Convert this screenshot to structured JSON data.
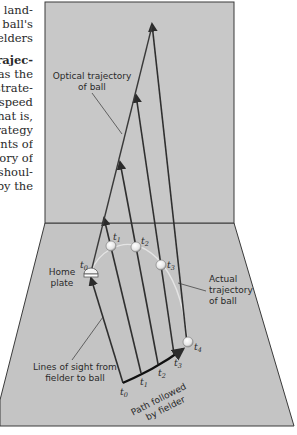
{
  "body_text": {
    "lines": [
      {
        "text": "land-",
        "bold": false
      },
      {
        "text": "y ball's",
        "bold": false
      },
      {
        "text": "elders",
        "bold": false
      },
      {
        "text": "",
        "bold": false,
        "gap": true
      },
      {
        "text": "trajec-",
        "bold": true
      },
      {
        "text": "as the",
        "bold": false
      },
      {
        "text": "strate-",
        "bold": false
      },
      {
        "text": "speed",
        "bold": false
      },
      {
        "text": "that is,",
        "bold": false
      },
      {
        "text": "trategy",
        "bold": false
      },
      {
        "text": "ents of",
        "bold": false
      },
      {
        "text": "tory of",
        "bold": false
      },
      {
        "text": "shoul-",
        "bold": false
      },
      {
        "text": "by the",
        "bold": false
      }
    ]
  },
  "diagram": {
    "colors": {
      "panel_fill": "#c8c8c8",
      "floor_fill": "#c4c4c4",
      "panel_stroke": "#3a3a3a",
      "line_dark": "#333333",
      "trajectory_light": "#dedede",
      "ball_fill": "#f2f2f2"
    },
    "labels": {
      "optical_trajectory_line1": "Optical trajectory",
      "optical_trajectory_line2": "of ball",
      "home_plate_line1": "Home",
      "home_plate_line2": "plate",
      "actual_trajectory_line1": "Actual",
      "actual_trajectory_line2": "trajectory",
      "actual_trajectory_line3": "of ball",
      "lines_of_sight_line1": "Lines of sight from",
      "lines_of_sight_line2": "fielder to ball",
      "path_followed_line1": "Path followed",
      "path_followed_line2": "by fielder"
    },
    "time_labels": {
      "ball": [
        "t0",
        "t1",
        "t2",
        "t3",
        "t4"
      ],
      "fielder": [
        "t0",
        "t1",
        "t2",
        "t3"
      ],
      "letter": "t",
      "subs": [
        "0",
        "1",
        "2",
        "3",
        "4"
      ]
    }
  }
}
